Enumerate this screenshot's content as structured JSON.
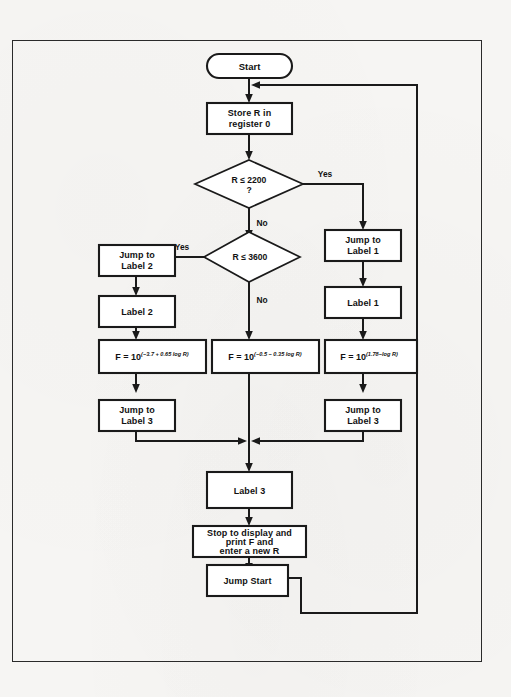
{
  "document": {
    "type": "flowchart",
    "title": "Resistance to Frequency Conversion Program Flowchart",
    "background_color": "#f6f5f3",
    "line_color": "#1a1a1a",
    "node_fill": "#ffffff"
  },
  "nodes": {
    "start": {
      "label": "Start",
      "shape": "terminator"
    },
    "store": {
      "label_line1": "Store R in",
      "label_line2": "register 0",
      "shape": "process"
    },
    "decision1": {
      "label_line1": "R ≤ 2200",
      "label_line2": "?",
      "shape": "decision",
      "yes_label": "Yes",
      "no_label": "No"
    },
    "decision2": {
      "label_line1": "R ≤ 3600",
      "label_line2": "",
      "shape": "decision",
      "yes_label": "Yes",
      "no_label": "No"
    },
    "jump_label1": {
      "label_line1": "Jump to",
      "label_line2": "Label 1",
      "shape": "process"
    },
    "label1": {
      "label": "Label 1",
      "shape": "process"
    },
    "jump_label2": {
      "label_line1": "Jump to",
      "label_line2": "Label 2",
      "shape": "process"
    },
    "label2": {
      "label": "Label 2",
      "shape": "process"
    },
    "formula_left": {
      "base": "F = 10",
      "exponent": "(−3.7 + 0.65 log R)",
      "shape": "process"
    },
    "formula_center": {
      "base": "F = 10",
      "exponent": "(−0.5 − 0.35 log R)",
      "shape": "process"
    },
    "formula_right": {
      "base": "F = 10",
      "exponent": "(1.78−log R)",
      "shape": "process"
    },
    "jump_label3_left": {
      "label_line1": "Jump to",
      "label_line2": "Label 3",
      "shape": "process"
    },
    "jump_label3_right": {
      "label_line1": "Jump to",
      "label_line2": "Label 3",
      "shape": "process"
    },
    "label3": {
      "label": "Label 3",
      "shape": "process"
    },
    "stop_display": {
      "label_line1": "Stop to display and",
      "label_line2": "print F and",
      "label_line3": "enter a new R",
      "shape": "process"
    },
    "jump_start": {
      "label": "Jump Start",
      "shape": "process"
    }
  },
  "edges": [
    {
      "from": "start",
      "to": "store",
      "label": ""
    },
    {
      "from": "store",
      "to": "decision1",
      "label": ""
    },
    {
      "from": "decision1",
      "to": "jump_label1",
      "label": "Yes"
    },
    {
      "from": "decision1",
      "to": "decision2",
      "label": "No"
    },
    {
      "from": "decision2",
      "to": "jump_label2",
      "label": "Yes"
    },
    {
      "from": "decision2",
      "to": "formula_center",
      "label": "No"
    },
    {
      "from": "jump_label1",
      "to": "label1",
      "label": ""
    },
    {
      "from": "label1",
      "to": "formula_right",
      "label": ""
    },
    {
      "from": "formula_right",
      "to": "jump_label3_right",
      "label": ""
    },
    {
      "from": "jump_label2",
      "to": "label2",
      "label": ""
    },
    {
      "from": "label2",
      "to": "formula_left",
      "label": ""
    },
    {
      "from": "formula_left",
      "to": "jump_label3_left",
      "label": ""
    },
    {
      "from": "jump_label3_left",
      "to": "label3",
      "label": ""
    },
    {
      "from": "formula_center",
      "to": "label3",
      "label": ""
    },
    {
      "from": "jump_label3_right",
      "to": "label3",
      "label": ""
    },
    {
      "from": "label3",
      "to": "stop_display",
      "label": ""
    },
    {
      "from": "stop_display",
      "to": "jump_start",
      "label": ""
    },
    {
      "from": "jump_start",
      "to": "store",
      "label": ""
    }
  ]
}
